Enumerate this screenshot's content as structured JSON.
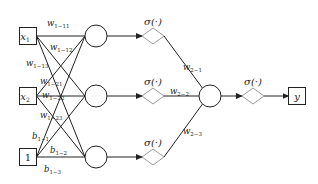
{
  "diagram": {
    "title": "",
    "inputs": [
      {
        "id": "x1",
        "label": "x",
        "sub": "1",
        "cx": 28,
        "cy": 36
      },
      {
        "id": "x2",
        "label": "x",
        "sub": "2",
        "cx": 28,
        "cy": 96
      },
      {
        "id": "bias",
        "label": "1",
        "sub": "",
        "cx": 28,
        "cy": 157
      }
    ],
    "hidden": [
      {
        "id": "h1",
        "cx": 96,
        "cy": 36
      },
      {
        "id": "h2",
        "cx": 96,
        "cy": 96
      },
      {
        "id": "h3",
        "cx": 96,
        "cy": 157
      }
    ],
    "activations_hidden": [
      {
        "label": "σ(·)",
        "cx": 153,
        "cy": 36
      },
      {
        "label": "σ(·)",
        "cx": 153,
        "cy": 96
      },
      {
        "label": "σ(·)",
        "cx": 153,
        "cy": 157
      }
    ],
    "output_node": {
      "id": "o1",
      "cx": 210,
      "cy": 96
    },
    "activation_output": {
      "label": "σ(·)",
      "cx": 253,
      "cy": 96
    },
    "output": {
      "label": "y",
      "cx": 297,
      "cy": 96
    },
    "weights_layer1": [
      {
        "label": "w",
        "sub": "1−11",
        "x": 47,
        "y": 26
      },
      {
        "label": "w",
        "sub": "1−12",
        "x": 50,
        "y": 50
      },
      {
        "label": "w",
        "sub": "1−13",
        "x": 26,
        "y": 66
      },
      {
        "label": "w",
        "sub": "1−21",
        "x": 40,
        "y": 84
      },
      {
        "label": "w",
        "sub": "1−22",
        "x": 42,
        "y": 98
      },
      {
        "label": "w",
        "sub": "1−23",
        "x": 40,
        "y": 118
      },
      {
        "label": "b",
        "sub": "1−1",
        "x": 32,
        "y": 139
      },
      {
        "label": "b",
        "sub": "1−2",
        "x": 50,
        "y": 153
      },
      {
        "label": "b",
        "sub": "1−3",
        "x": 44,
        "y": 172
      }
    ],
    "weights_layer2": [
      {
        "label": "w",
        "sub": "2−1",
        "x": 183,
        "y": 70
      },
      {
        "label": "w",
        "sub": "2−2",
        "x": 170,
        "y": 94
      },
      {
        "label": "w",
        "sub": "2−3",
        "x": 183,
        "y": 134
      }
    ]
  }
}
